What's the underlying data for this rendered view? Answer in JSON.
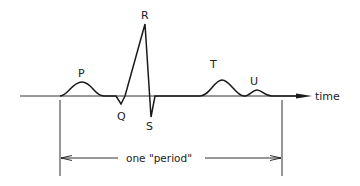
{
  "diagram": {
    "type": "ecg-waveform",
    "colors": {
      "stroke": "#1a1a1a",
      "text": "#222222",
      "background": "#ffffff"
    },
    "axis": {
      "label": "time"
    },
    "waves": [
      {
        "id": "P",
        "label": "P"
      },
      {
        "id": "Q",
        "label": "Q"
      },
      {
        "id": "R",
        "label": "R"
      },
      {
        "id": "S",
        "label": "S"
      },
      {
        "id": "T",
        "label": "T"
      },
      {
        "id": "U",
        "label": "U"
      }
    ],
    "period": {
      "label": "one \"period\""
    }
  }
}
